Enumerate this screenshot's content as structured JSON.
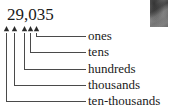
{
  "diagram": {
    "number": "29,035",
    "digits": [
      "2",
      "9",
      "0",
      "3",
      "5"
    ],
    "colors": {
      "line": "#4a4a4a",
      "text": "#1a1a1a",
      "background": "#ffffff",
      "photo": "#6b6b6b"
    },
    "places": [
      {
        "label": "ones",
        "digit": "5",
        "arrow_x": 36,
        "line_y": 36
      },
      {
        "label": "tens",
        "digit": "3",
        "arrow_x": 30,
        "line_y": 52
      },
      {
        "label": "hundreds",
        "digit": "0",
        "arrow_x": 24,
        "line_y": 69
      },
      {
        "label": "thousands",
        "digit": "9",
        "arrow_x": 14,
        "line_y": 85
      },
      {
        "label": "ten-thousands",
        "digit": "2",
        "arrow_x": 6,
        "line_y": 101
      }
    ]
  }
}
